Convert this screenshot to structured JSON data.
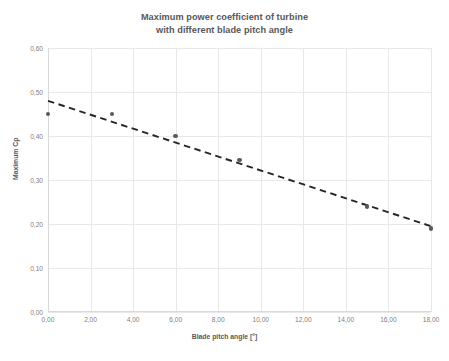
{
  "chart_data": {
    "type": "scatter",
    "title": "Maximum power coefficient of turbine with different blade pitch angle",
    "title_lines": [
      "Maximum power coefficient of turbine",
      "with different blade pitch angle"
    ],
    "xlabel": "Blade pitch angle [°]",
    "ylabel": "Maximum Cp",
    "xlim": [
      0,
      18
    ],
    "ylim": [
      0,
      0.6
    ],
    "grid": true,
    "legend": null,
    "xticks": [
      0,
      2,
      4,
      6,
      8,
      10,
      12,
      14,
      16,
      18
    ],
    "xticklabels": [
      "0,00",
      "2,00",
      "4,00",
      "6,00",
      "8,00",
      "10,00",
      "12,00",
      "14,00",
      "16,00",
      "18,00"
    ],
    "yticks": [
      0,
      0.1,
      0.2,
      0.3,
      0.4,
      0.5,
      0.6
    ],
    "yticklabels": [
      "0,00",
      "0,10",
      "0,20",
      "0,30",
      "0,40",
      "0,50",
      "0,60"
    ],
    "series": [
      {
        "name": "Maximum Cp",
        "marker": "circle",
        "color": "#5a5a5a",
        "x": [
          0,
          3,
          6,
          9,
          15,
          18
        ],
        "y": [
          0.45,
          0.45,
          0.4,
          0.345,
          0.24,
          0.19
        ]
      }
    ],
    "trendline": {
      "name": "Linear trendline",
      "style": "dashed",
      "color": "#262626",
      "x": [
        0,
        18
      ],
      "y": [
        0.48,
        0.195
      ]
    }
  },
  "axes": {
    "x_title": "Blade pitch angle [°]",
    "y_title": "Maximum Cp"
  },
  "colors": {
    "background": "#ffffff",
    "grid": "#e8e8e8",
    "axis": "#d9d9d9",
    "text": "#595959",
    "tick_text": "#808080",
    "marker": "#5a5a5a",
    "trendline": "#262626"
  }
}
